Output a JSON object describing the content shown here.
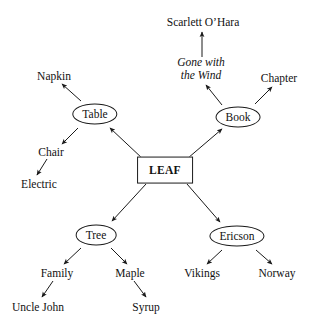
{
  "diagram": {
    "type": "semantic-network",
    "background_color": "#ffffff",
    "line_color": "#1a1a1a",
    "text_color": "#111111",
    "width": 312,
    "height": 330,
    "nodes": [
      {
        "id": "leaf",
        "label": "LEAF",
        "shape": "rectangle",
        "x": 165,
        "y": 170
      },
      {
        "id": "table",
        "label": "Table",
        "shape": "ellipse",
        "x": 95,
        "y": 114
      },
      {
        "id": "book",
        "label": "Book",
        "shape": "ellipse",
        "x": 238,
        "y": 117
      },
      {
        "id": "tree",
        "label": "Tree",
        "shape": "ellipse",
        "x": 96,
        "y": 235
      },
      {
        "id": "ericson",
        "label": "Ericson",
        "shape": "ellipse",
        "x": 237,
        "y": 236
      },
      {
        "id": "napkin",
        "label": "Napkin",
        "shape": "plain",
        "x": 54,
        "y": 76
      },
      {
        "id": "chair",
        "label": "Chair",
        "shape": "plain",
        "x": 51,
        "y": 152
      },
      {
        "id": "electric",
        "label": "Electric",
        "shape": "plain",
        "x": 39,
        "y": 184
      },
      {
        "id": "gone",
        "label": "Gone with\nthe Wind",
        "shape": "italic",
        "x": 201,
        "y": 69
      },
      {
        "id": "scarlett",
        "label": "Scarlett O’Hara",
        "shape": "plain",
        "x": 203,
        "y": 22
      },
      {
        "id": "chapter",
        "label": "Chapter",
        "shape": "plain",
        "x": 279,
        "y": 78
      },
      {
        "id": "family",
        "label": "Family",
        "shape": "plain",
        "x": 57,
        "y": 273
      },
      {
        "id": "uncle_john",
        "label": "Uncle John",
        "shape": "plain",
        "x": 38,
        "y": 307
      },
      {
        "id": "maple",
        "label": "Maple",
        "shape": "plain",
        "x": 130,
        "y": 273
      },
      {
        "id": "syrup",
        "label": "Syrup",
        "shape": "plain",
        "x": 146,
        "y": 307
      },
      {
        "id": "vikings",
        "label": "Vikings",
        "shape": "plain",
        "x": 202,
        "y": 273
      },
      {
        "id": "norway",
        "label": "Norway",
        "shape": "plain",
        "x": 277,
        "y": 273
      }
    ],
    "edges": [
      {
        "from": "leaf",
        "to": "table",
        "x1": 143,
        "y1": 159,
        "x2": 110,
        "y2": 128
      },
      {
        "from": "leaf",
        "to": "book",
        "x1": 188,
        "y1": 158,
        "x2": 222,
        "y2": 129
      },
      {
        "from": "leaf",
        "to": "tree",
        "x1": 146,
        "y1": 184,
        "x2": 112,
        "y2": 221
      },
      {
        "from": "leaf",
        "to": "ericson",
        "x1": 187,
        "y1": 184,
        "x2": 220,
        "y2": 222
      },
      {
        "from": "table",
        "to": "napkin",
        "x1": 81,
        "y1": 101,
        "x2": 62,
        "y2": 84
      },
      {
        "from": "table",
        "to": "chair",
        "x1": 78,
        "y1": 128,
        "x2": 62,
        "y2": 144
      },
      {
        "from": "chair",
        "to": "electric",
        "x1": 47,
        "y1": 159,
        "x2": 37,
        "y2": 175
      },
      {
        "from": "book",
        "to": "gone",
        "x1": 222,
        "y1": 105,
        "x2": 206,
        "y2": 85
      },
      {
        "from": "gone",
        "to": "scarlett",
        "x1": 202,
        "y1": 57,
        "x2": 202,
        "y2": 32
      },
      {
        "from": "book",
        "to": "chapter",
        "x1": 255,
        "y1": 104,
        "x2": 272,
        "y2": 87
      },
      {
        "from": "tree",
        "to": "family",
        "x1": 81,
        "y1": 248,
        "x2": 64,
        "y2": 264
      },
      {
        "from": "family",
        "to": "uncle_john",
        "x1": 53,
        "y1": 281,
        "x2": 42,
        "y2": 297
      },
      {
        "from": "tree",
        "to": "maple",
        "x1": 111,
        "y1": 248,
        "x2": 127,
        "y2": 264
      },
      {
        "from": "maple",
        "to": "syrup",
        "x1": 134,
        "y1": 281,
        "x2": 146,
        "y2": 297
      },
      {
        "from": "ericson",
        "to": "vikings",
        "x1": 222,
        "y1": 250,
        "x2": 207,
        "y2": 264
      },
      {
        "from": "ericson",
        "to": "norway",
        "x1": 256,
        "y1": 250,
        "x2": 272,
        "y2": 264
      }
    ]
  }
}
